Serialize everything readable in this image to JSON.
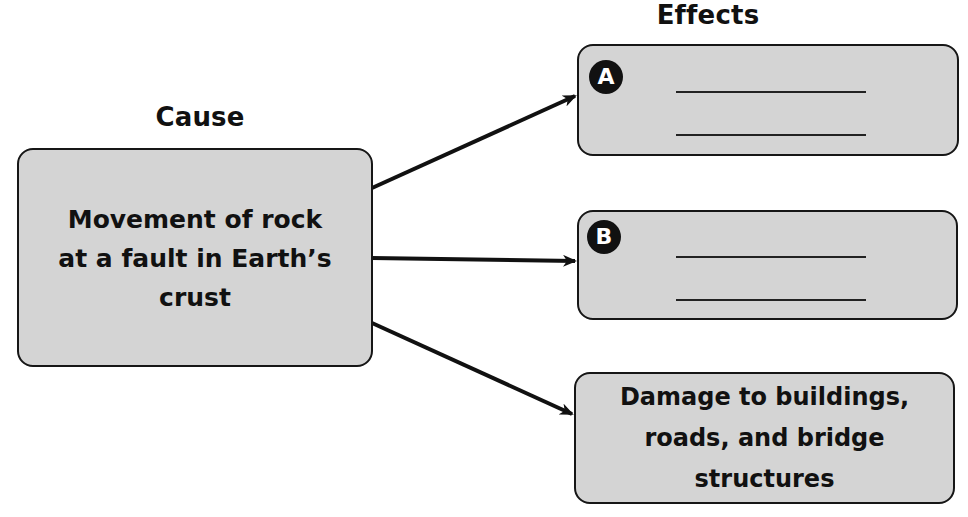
{
  "diagram": {
    "type": "cause-and-effect",
    "cause": {
      "heading": "Cause",
      "text": "Movement of rock\nat a fault in Earth’s\ncrust"
    },
    "effects": {
      "heading": "Effects",
      "items": [
        {
          "label": "A",
          "text": "",
          "answer_lines": 2
        },
        {
          "label": "B",
          "text": "",
          "answer_lines": 2
        },
        {
          "label": "",
          "text": "Damage to buildings,\nroads, and bridge\nstructures"
        }
      ]
    },
    "colors": {
      "box_fill": "#d4d4d4",
      "box_border": "#161616",
      "arrow": "#111111",
      "badge_fill": "#111111",
      "badge_text": "#ffffff"
    }
  }
}
